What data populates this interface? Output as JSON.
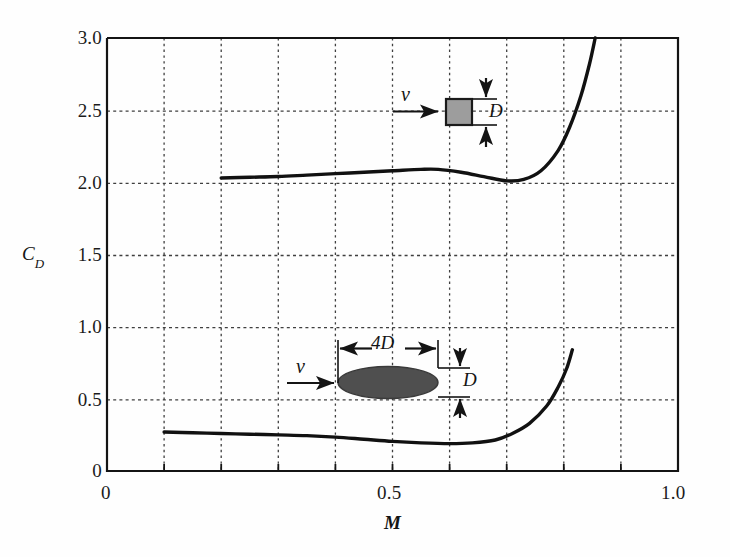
{
  "figure": {
    "background_color": "#fefefe",
    "line_color": "#111111",
    "grid_color": "#4d4d4d"
  },
  "chart_data": {
    "type": "line",
    "title": "",
    "xlabel": "M",
    "ylabel": "C_D",
    "xlim": [
      0,
      1.0
    ],
    "ylim": [
      0,
      3.0
    ],
    "grid": true,
    "x_major_ticks": [
      0,
      0.5,
      1.0
    ],
    "x_major_tick_labels": [
      "0",
      "0.5",
      "1.0"
    ],
    "x_minor_gridlines": [
      0.1,
      0.2,
      0.3,
      0.4,
      0.5,
      0.6,
      0.7,
      0.8,
      0.9
    ],
    "y_ticks": [
      0,
      0.5,
      1.0,
      1.5,
      2.0,
      2.5,
      3.0
    ],
    "y_tick_labels": [
      "0",
      "0.5",
      "1.0",
      "1.5",
      "2.0",
      "2.5",
      "3.0"
    ],
    "y_gridlines": [
      0.5,
      1.0,
      1.5,
      2.0,
      2.5
    ],
    "legend": "none",
    "series": [
      {
        "name": "square-cylinder",
        "description": "Drag coefficient of a square cross-section body",
        "x": [
          0.2,
          0.25,
          0.3,
          0.35,
          0.4,
          0.45,
          0.5,
          0.55,
          0.58,
          0.62,
          0.66,
          0.7,
          0.73,
          0.76,
          0.79,
          0.81,
          0.83,
          0.845,
          0.855
        ],
        "y": [
          2.03,
          2.035,
          2.04,
          2.05,
          2.06,
          2.07,
          2.08,
          2.09,
          2.09,
          2.07,
          2.04,
          2.01,
          2.02,
          2.08,
          2.22,
          2.38,
          2.6,
          2.82,
          3.0
        ]
      },
      {
        "name": "ellipse-4D-by-D",
        "description": "Drag coefficient of a 4D-by-D elliptical cross-section body",
        "x": [
          0.1,
          0.15,
          0.2,
          0.25,
          0.3,
          0.35,
          0.4,
          0.45,
          0.5,
          0.55,
          0.6,
          0.64,
          0.68,
          0.71,
          0.74,
          0.77,
          0.79,
          0.805,
          0.815
        ],
        "y": [
          0.27,
          0.265,
          0.26,
          0.255,
          0.25,
          0.245,
          0.235,
          0.22,
          0.205,
          0.195,
          0.19,
          0.195,
          0.215,
          0.26,
          0.33,
          0.45,
          0.58,
          0.71,
          0.84
        ]
      }
    ],
    "annotations": [
      {
        "name": "square-body-icon",
        "shape": "square",
        "fill": "#9d9d9d",
        "stroke": "#1a1a1a",
        "center_x": 0.595,
        "center_y": 2.5,
        "velocity_label": "v",
        "height_label": "D"
      },
      {
        "name": "ellipse-body-icon",
        "shape": "ellipse",
        "fill": "#4f4f4f",
        "stroke": "#1a1a1a",
        "center_x": 0.505,
        "center_y": 0.62,
        "velocity_label": "v",
        "length_label": "4D",
        "height_label": "D"
      }
    ]
  },
  "labels": {
    "y_axis_title_main": "C",
    "y_axis_title_sub": "D",
    "x_axis_title": "M",
    "velocity_top": "v",
    "velocity_bottom": "v",
    "diameter_top": "D",
    "diameter_bottom": "D",
    "length_bottom": "4D"
  }
}
